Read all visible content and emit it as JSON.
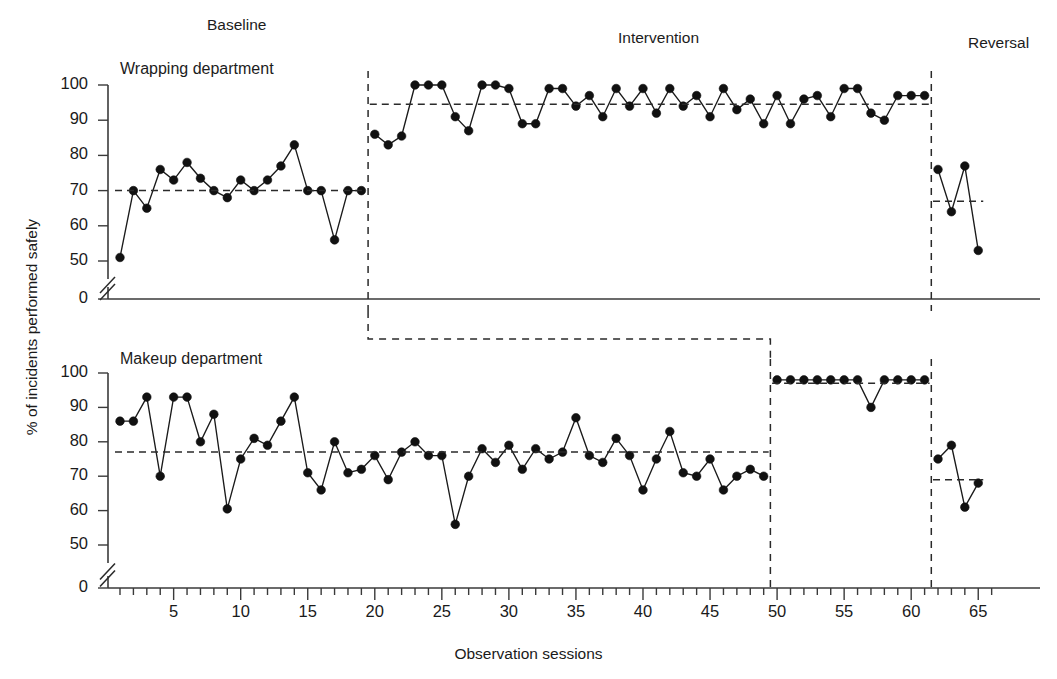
{
  "figure": {
    "xlabel": "Observation sessions",
    "ylabel": "% of incidents performed safely",
    "phase_labels": {
      "baseline": "Baseline",
      "intervention": "Intervention",
      "reversal": "Reversal"
    },
    "panel_titles": {
      "top": "Wrapping department",
      "bottom": "Makeup department"
    }
  },
  "axes": {
    "ytick_labels": [
      "100",
      "90",
      "80",
      "70",
      "60",
      "50",
      "0"
    ],
    "ytick_values": [
      100,
      90,
      80,
      70,
      60,
      50,
      0
    ],
    "xtick_labels": [
      "5",
      "10",
      "15",
      "20",
      "25",
      "30",
      "35",
      "40",
      "45",
      "50",
      "55",
      "60",
      "65"
    ],
    "xtick_values": [
      5,
      10,
      15,
      20,
      25,
      30,
      35,
      40,
      45,
      50,
      55,
      60,
      65
    ],
    "xlim": [
      1,
      66
    ],
    "ylim": [
      0,
      100
    ],
    "axis_break": true,
    "grid": false
  },
  "chart_data": {
    "type": "line",
    "title": "",
    "xlabel": "Observation sessions",
    "ylabel": "% of incidents performed safely",
    "ylim": [
      0,
      100
    ],
    "xlim": [
      1,
      66
    ],
    "legend": "none",
    "design": "ABA multiple-baseline across departments",
    "panels": [
      {
        "name": "Wrapping department",
        "phases": [
          {
            "label": "Baseline",
            "x_start": 1,
            "x_end": 19,
            "mean_line": 70,
            "x": [
              1,
              2,
              3,
              4,
              5,
              6,
              7,
              8,
              9,
              10,
              11,
              12,
              13,
              14,
              15,
              16,
              17,
              18,
              19
            ],
            "y": [
              51,
              70,
              65,
              76,
              73,
              78,
              73.5,
              70,
              68,
              73,
              70,
              73,
              77,
              83,
              70,
              70,
              56,
              70,
              70
            ]
          },
          {
            "label": "Intervention",
            "x_start": 20,
            "x_end": 61,
            "mean_line": 94.5,
            "x": [
              20,
              21,
              22,
              23,
              24,
              25,
              26,
              27,
              28,
              29,
              30,
              31,
              32,
              33,
              34,
              35,
              36,
              37,
              38,
              39,
              40,
              41,
              42,
              43,
              44,
              45,
              46,
              47,
              48,
              49,
              50,
              51,
              52,
              53,
              54,
              55,
              56,
              57,
              58,
              59,
              60,
              61
            ],
            "y": [
              86,
              83,
              85.5,
              100,
              100,
              100,
              91,
              87,
              100,
              100,
              99,
              89,
              89,
              99,
              99,
              94,
              97,
              91,
              99,
              94,
              99,
              92,
              99,
              94,
              97,
              91,
              99,
              93,
              96,
              89,
              97,
              89,
              96,
              97,
              91,
              99,
              99,
              92,
              90,
              97,
              97,
              97
            ]
          },
          {
            "label": "Reversal",
            "x_start": 62,
            "x_end": 65,
            "mean_line": 67,
            "x": [
              62,
              63,
              64,
              65
            ],
            "y": [
              76,
              64,
              77,
              53
            ]
          }
        ]
      },
      {
        "name": "Makeup department",
        "phases": [
          {
            "label": "Baseline",
            "x_start": 1,
            "x_end": 49,
            "mean_line": 77,
            "x": [
              1,
              2,
              3,
              4,
              5,
              6,
              7,
              8,
              9,
              10,
              11,
              12,
              13,
              14,
              15,
              16,
              17,
              18,
              19,
              20,
              21,
              22,
              23,
              24,
              25,
              26,
              27,
              28,
              29,
              30,
              31,
              32,
              33,
              34,
              35,
              36,
              37,
              38,
              39,
              40,
              41,
              42,
              43,
              44,
              45,
              46,
              47,
              48,
              49
            ],
            "y": [
              86,
              86,
              93,
              70,
              93,
              93,
              80,
              88,
              60.5,
              75,
              81,
              79,
              86,
              93,
              71,
              66,
              80,
              71,
              72,
              76,
              69,
              77,
              80,
              76,
              76,
              56,
              70,
              78,
              74,
              79,
              72,
              78,
              75,
              77,
              87,
              76,
              74,
              81,
              76,
              66,
              75,
              83,
              71,
              70,
              75,
              66,
              70,
              72,
              70
            ]
          },
          {
            "label": "Intervention",
            "x_start": 50,
            "x_end": 61,
            "mean_line": 97,
            "x": [
              50,
              51,
              52,
              53,
              54,
              55,
              56,
              57,
              58,
              59,
              60,
              61
            ],
            "y": [
              98,
              98,
              98,
              98,
              98,
              98,
              98,
              90,
              98,
              98,
              98,
              98
            ]
          },
          {
            "label": "Reversal",
            "x_start": 62,
            "x_end": 65,
            "mean_line": 69,
            "x": [
              62,
              63,
              64,
              65
            ],
            "y": [
              75,
              79,
              61,
              68
            ]
          }
        ]
      }
    ]
  }
}
